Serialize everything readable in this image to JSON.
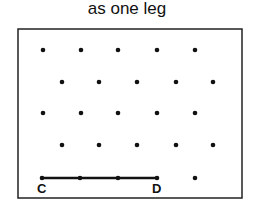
{
  "title": "as one leg",
  "grid": {
    "frame": {
      "x": 18,
      "y": 29,
      "width": 224,
      "height": 169
    },
    "dot_color": "#111111",
    "rows": [
      {
        "y": 50,
        "xs": [
          43,
          81,
          118,
          157,
          195
        ]
      },
      {
        "y": 82,
        "xs": [
          62,
          99,
          137,
          176,
          213
        ]
      },
      {
        "y": 113,
        "xs": [
          43,
          81,
          118,
          157,
          195
        ]
      },
      {
        "y": 145,
        "xs": [
          62,
          99,
          137,
          176,
          213
        ]
      },
      {
        "y": 178,
        "xs": [
          42,
          80,
          118,
          157,
          195
        ]
      }
    ]
  },
  "segment": {
    "from": "C",
    "to": "D",
    "x1": 42,
    "y1": 178,
    "x2": 157,
    "y2": 178
  },
  "labels": {
    "c": "C",
    "d": "D"
  }
}
